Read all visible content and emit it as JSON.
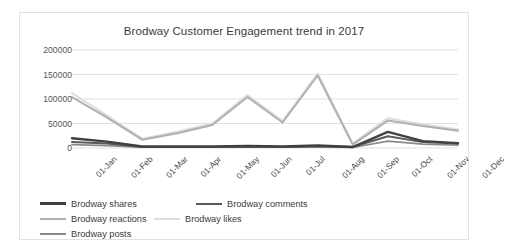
{
  "chart_data": {
    "type": "line",
    "title": "Brodway Customer Engagement trend in 2017",
    "xlabel": "",
    "ylabel": "",
    "ylim": [
      0,
      200000
    ],
    "ytick_values": [
      0,
      50000,
      100000,
      150000,
      200000
    ],
    "ytick_labels": [
      "0",
      "50000",
      "100000",
      "150000",
      "200000"
    ],
    "grid": true,
    "legend_position": "bottom",
    "categories": [
      "01-Jan",
      "01-Feb",
      "01-Mar",
      "01-Apr",
      "01-May",
      "01-Jun",
      "01-Jul",
      "01-Aug",
      "01-Sep",
      "01-Oct",
      "01-Nov",
      "01-Dec"
    ],
    "series": [
      {
        "name": "Brodway shares",
        "color": "#404040",
        "values": [
          20000,
          13000,
          3000,
          3000,
          3000,
          4000,
          3000,
          5000,
          2000,
          33000,
          14000,
          10000
        ]
      },
      {
        "name": "Brodway comments",
        "color": "#5a5a5a",
        "values": [
          12000,
          9000,
          2000,
          2000,
          2000,
          3000,
          2000,
          4000,
          2000,
          24000,
          12000,
          9000
        ]
      },
      {
        "name": "Brodway reactions",
        "color": "#b0b0b0",
        "values": [
          104000,
          62000,
          17000,
          30000,
          47000,
          104000,
          52000,
          148000,
          7000,
          56000,
          45000,
          35000
        ]
      },
      {
        "name": "Brodway likes",
        "color": "#dcdcdc",
        "values": [
          112000,
          66000,
          19000,
          33000,
          50000,
          108000,
          55000,
          152000,
          9000,
          61000,
          48000,
          38000
        ]
      },
      {
        "name": "Brodway posts",
        "color": "#8a8a8a",
        "values": [
          7000,
          5000,
          1500,
          1500,
          1500,
          2000,
          1500,
          2500,
          1000,
          14000,
          8000,
          6000
        ]
      }
    ]
  },
  "legend": {
    "items": [
      {
        "label": "Brodway shares",
        "color": "#404040",
        "width": 3.2
      },
      {
        "label": "Brodway comments",
        "color": "#5a5a5a",
        "width": 2.6
      },
      {
        "label": "Brodway reactions",
        "color": "#b0b0b0",
        "width": 2.0
      },
      {
        "label": "Brodway likes",
        "color": "#dcdcdc",
        "width": 2.0
      },
      {
        "label": "Brodway posts",
        "color": "#8a8a8a",
        "width": 2.2
      }
    ]
  }
}
